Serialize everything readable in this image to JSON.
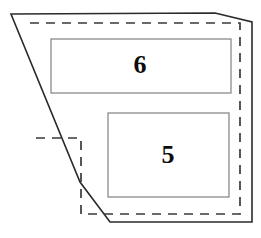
{
  "figure": {
    "canvas": {
      "width": 261,
      "height": 238,
      "background": "#ffffff"
    },
    "outer_boundary": {
      "name": "site-outline",
      "style": "solid",
      "color": "#2b2b2b",
      "points": "11,14 215,13 252,22 252,222 110,222 80,182"
    },
    "inner_boundary": {
      "name": "setback-outline",
      "style": "dashed",
      "color": "#3a3a3a",
      "points": "30,23 240,23 240,214 81,214 81,138 30,138"
    },
    "rooms": [
      {
        "id": "room-6",
        "label": "6",
        "x": 51,
        "y": 39,
        "width": 180,
        "height": 54,
        "stroke": "#8a8a8a"
      },
      {
        "id": "room-5",
        "label": "5",
        "x": 108,
        "y": 113,
        "width": 121,
        "height": 84,
        "stroke": "#8a8a8a"
      }
    ]
  }
}
